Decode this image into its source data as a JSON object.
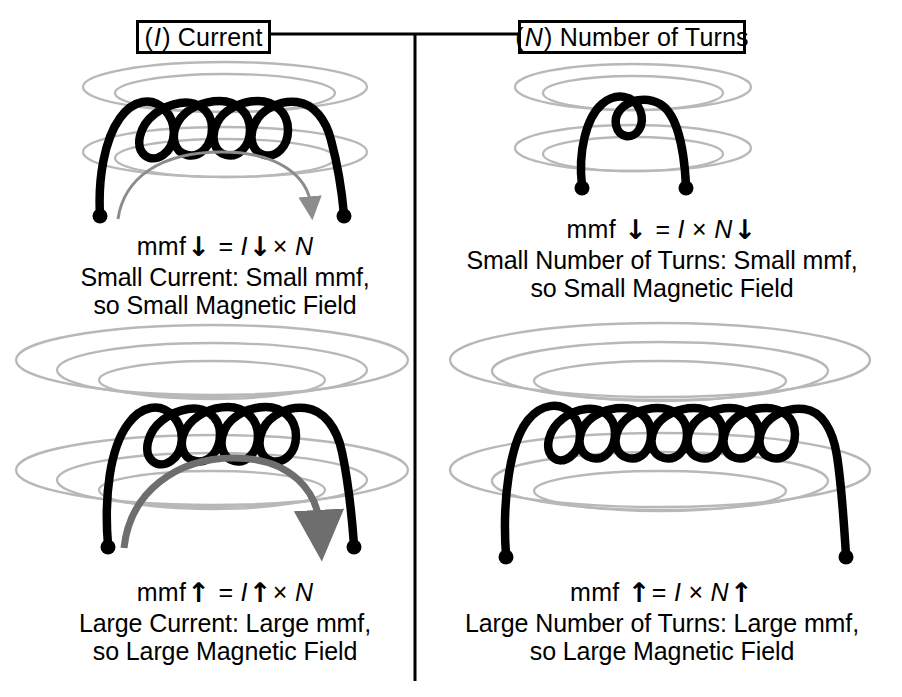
{
  "diagram": {
    "title_headers": [
      {
        "id": "current",
        "label_prefix": "(",
        "label_italic": "I",
        "label_suffix": ") Current"
      },
      {
        "id": "turns",
        "label_prefix": "(",
        "label_italic": "N",
        "label_suffix": ") Number of Turns"
      }
    ],
    "headers_plain": {
      "current": "(I) Current",
      "turns": "(N) Number of Turns"
    },
    "panels": [
      {
        "id": "small-current",
        "column": "current",
        "row": "small",
        "coil_turns": 4,
        "field_rings_per_group": 2,
        "field_size": "small",
        "current_arrow": {
          "present": true,
          "weight": "thin",
          "color": "#8c8c8c",
          "direction": "left-to-right"
        },
        "formula": {
          "lhs": "mmf",
          "lhs_arrow": "down",
          "eq": "=",
          "i_symbol": "I",
          "i_arrow": "down",
          "times": "×",
          "n_symbol": "N",
          "n_arrow": "none"
        },
        "caption_line1": "Small Current: Small mmf,",
        "caption_line2": "so Small Magnetic Field"
      },
      {
        "id": "small-turns",
        "column": "turns",
        "row": "small",
        "coil_turns": 1,
        "field_rings_per_group": 2,
        "field_size": "small",
        "current_arrow": {
          "present": false,
          "weight": "none",
          "color": "",
          "direction": ""
        },
        "formula": {
          "lhs": "mmf",
          "lhs_arrow": "down",
          "eq": "=",
          "i_symbol": "I",
          "i_arrow": "none",
          "times": "×",
          "n_symbol": "N",
          "n_arrow": "down"
        },
        "caption_line1": "Small Number of Turns: Small mmf,",
        "caption_line2": "so Small Magnetic Field"
      },
      {
        "id": "large-current",
        "column": "current",
        "row": "large",
        "coil_turns": 4,
        "field_rings_per_group": 3,
        "field_size": "large",
        "current_arrow": {
          "present": true,
          "weight": "thick",
          "color": "#6e6e6e",
          "direction": "left-to-right"
        },
        "formula": {
          "lhs": "mmf",
          "lhs_arrow": "up",
          "eq": "=",
          "i_symbol": "I",
          "i_arrow": "up",
          "times": "×",
          "n_symbol": "N",
          "n_arrow": "none"
        },
        "caption_line1": "Large Current: Large mmf,",
        "caption_line2": "so Large Magnetic Field"
      },
      {
        "id": "large-turns",
        "column": "turns",
        "row": "large",
        "coil_turns": 7,
        "field_rings_per_group": 3,
        "field_size": "large",
        "current_arrow": {
          "present": false,
          "weight": "none",
          "color": "",
          "direction": ""
        },
        "formula": {
          "lhs": "mmf",
          "lhs_arrow": "up",
          "eq": "=",
          "i_symbol": "I",
          "i_arrow": "none",
          "times": "×",
          "n_symbol": "N",
          "n_arrow": "up"
        },
        "caption_line1": "Large Number of Turns: Large mmf,",
        "caption_line2": "so Large Magnetic Field"
      }
    ],
    "symbols": {
      "arrow_up": "↑",
      "arrow_down": "↓",
      "multiply": "×"
    },
    "colors": {
      "ink": "#000000",
      "field_line": "#b8b8b8",
      "arrow_thin": "#8c8c8c",
      "arrow_thick": "#6e6e6e",
      "background": "#ffffff"
    }
  }
}
